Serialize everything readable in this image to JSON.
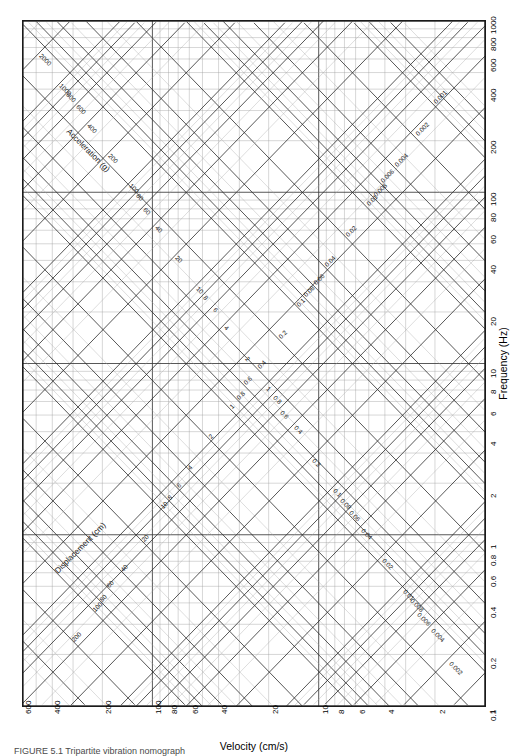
{
  "figure": {
    "type": "tripartite-nomograph",
    "caption": "FIGURE 5.1   Tripartite vibration nomograph"
  },
  "axes": {
    "x": {
      "title": "Velocity (cm/s)",
      "unit": "cm/s",
      "quantity": "Velocity",
      "direction": "reversed",
      "min": 1,
      "max": 600,
      "ticks": [
        600,
        400,
        200,
        100,
        80,
        60,
        40,
        20,
        10,
        8,
        6,
        4,
        2,
        1
      ],
      "tick_labels": [
        "600",
        "400",
        "200",
        "100",
        "80",
        "60",
        "40",
        "20",
        "10",
        "8",
        "6",
        "4",
        "2",
        "1"
      ]
    },
    "y": {
      "title": "Frequency (Hz)",
      "unit": "Hz",
      "quantity": "Frequency",
      "direction": "normal",
      "min": 0.1,
      "max": 1000,
      "ticks": [
        0.1,
        0.2,
        0.4,
        0.6,
        0.8,
        1,
        2,
        4,
        6,
        8,
        10,
        20,
        40,
        60,
        80,
        100,
        200,
        400,
        600,
        800,
        1000
      ],
      "tick_labels": [
        "0.1",
        "0.2",
        "0.4",
        "0.6",
        "0.8",
        "1",
        "2",
        "4",
        "6",
        "8",
        "10",
        "20",
        "40",
        "60",
        "80",
        "100",
        "200",
        "400",
        "600",
        "800",
        "1000"
      ]
    }
  },
  "diagonals": {
    "displacement": {
      "title": "Displacement (cm)",
      "unit": "cm",
      "quantity": "Displacement",
      "slope": "up-right",
      "labels": [
        "0.001",
        "0.002",
        "0.004",
        "0.006",
        "0.008",
        "0.01",
        "0.02",
        "0.04",
        "0.06",
        "0.08",
        "0.1",
        "0.2",
        "0.4",
        "0.6",
        "0.8",
        "1",
        "2",
        "4",
        "6",
        "8",
        "10",
        "20",
        "40",
        "60",
        "80",
        "100",
        "200"
      ]
    },
    "acceleration": {
      "title": "Acceleration (g)",
      "unit": "g",
      "quantity": "Acceleration",
      "slope": "down-right",
      "labels": [
        "0.002",
        "0.004",
        "0.006",
        "0.008",
        "0.01",
        "0.02",
        "0.04",
        "0.06",
        "0.08",
        "0.1",
        "0.2",
        "0.4",
        "0.6",
        "0.8",
        "1",
        "2",
        "4",
        "6",
        "8",
        "10",
        "20",
        "40",
        "60",
        "80",
        "100",
        "200",
        "400",
        "600",
        "800",
        "1000",
        "2000"
      ]
    }
  },
  "colors": {
    "frame": "#1a1a1a",
    "major_grid": "#3a3a3a",
    "minor_grid": "#9a9a9a",
    "diagonal_major": "#2c2c2c",
    "diagonal_minor": "#a5a5a5",
    "text": "#1a1a1a",
    "background": "#ffffff"
  }
}
